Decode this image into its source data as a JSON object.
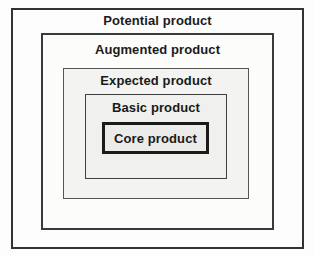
{
  "diagram": {
    "type": "nested-boxes",
    "levels": [
      {
        "label": "Potential product"
      },
      {
        "label": "Augmented product"
      },
      {
        "label": "Expected product"
      },
      {
        "label": "Basic product"
      },
      {
        "label": "Core product"
      }
    ],
    "colors": {
      "text": "#1a1a1a",
      "outer_border": "#333333",
      "inner_border_gray": "#555555",
      "core_border": "#1a1a1a",
      "outer_fill": "#fdfdfd",
      "expected_fill": "#f3f3f1",
      "basic_fill": "#f0f0ee",
      "core_fill": "#ebebe9"
    }
  }
}
